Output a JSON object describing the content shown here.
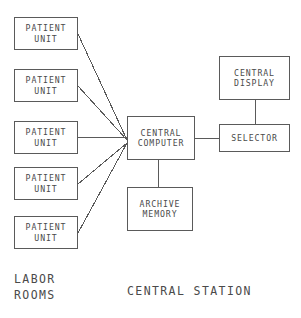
{
  "diagram": {
    "background_color": "#ffffff",
    "stroke_color": "#5a5a5a",
    "text_color": "#4a4a4a",
    "nodes": [
      {
        "id": "patient-unit-1",
        "line1": "PATIENT",
        "line2": "UNIT",
        "x": 14,
        "y": 17,
        "w": 64,
        "h": 33
      },
      {
        "id": "patient-unit-2",
        "line1": "PATIENT",
        "line2": "UNIT",
        "x": 14,
        "y": 69,
        "w": 64,
        "h": 33
      },
      {
        "id": "patient-unit-3",
        "line1": "PATIENT",
        "line2": "UNIT",
        "x": 14,
        "y": 121,
        "w": 64,
        "h": 33
      },
      {
        "id": "patient-unit-4",
        "line1": "PATIENT",
        "line2": "UNIT",
        "x": 14,
        "y": 167,
        "w": 64,
        "h": 33
      },
      {
        "id": "patient-unit-5",
        "line1": "PATIENT",
        "line2": "UNIT",
        "x": 14,
        "y": 216,
        "w": 64,
        "h": 33
      },
      {
        "id": "central-computer",
        "line1": "CENTRAL",
        "line2": "COMPUTER",
        "x": 127,
        "y": 116,
        "w": 68,
        "h": 44
      },
      {
        "id": "archive-memory",
        "line1": "ARCHIVE",
        "line2": "MEMORY",
        "x": 127,
        "y": 187,
        "w": 66,
        "h": 44
      },
      {
        "id": "central-display",
        "line1": "CENTRAL",
        "line2": "DISPLAY",
        "x": 219,
        "y": 56,
        "w": 71,
        "h": 44
      },
      {
        "id": "selector",
        "line1": "SELECTOR",
        "line2": "",
        "x": 219,
        "y": 124,
        "w": 71,
        "h": 28
      }
    ],
    "connections": [
      {
        "id": "wire-patient-1-to-computer",
        "x1": 78,
        "y1": 34,
        "x2": 127,
        "y2": 140
      },
      {
        "id": "wire-patient-2-to-computer",
        "x1": 78,
        "y1": 86,
        "x2": 127,
        "y2": 140
      },
      {
        "id": "wire-patient-3-to-computer",
        "x1": 78,
        "y1": 137,
        "x2": 127,
        "y2": 137
      },
      {
        "id": "wire-patient-4-to-computer",
        "x1": 78,
        "y1": 184,
        "x2": 127,
        "y2": 143
      },
      {
        "id": "wire-patient-5-to-computer",
        "x1": 78,
        "y1": 233,
        "x2": 127,
        "y2": 143
      },
      {
        "id": "wire-computer-to-archive",
        "x1": 158,
        "y1": 160,
        "x2": 158,
        "y2": 187
      },
      {
        "id": "wire-computer-to-selector",
        "x1": 195,
        "y1": 138,
        "x2": 219,
        "y2": 138
      },
      {
        "id": "wire-display-to-selector",
        "x1": 255,
        "y1": 100,
        "x2": 255,
        "y2": 124
      }
    ],
    "region_labels": [
      {
        "id": "labor-rooms-label",
        "text": "LABOR\nROOMS",
        "x": 14,
        "y": 272
      },
      {
        "id": "central-station-label",
        "text": "CENTRAL STATION",
        "x": 127,
        "y": 284
      }
    ]
  }
}
